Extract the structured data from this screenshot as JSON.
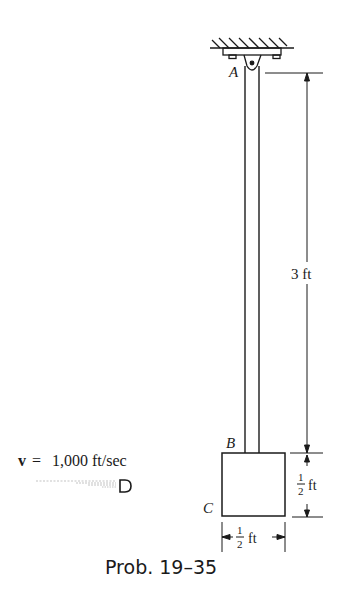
{
  "figure": {
    "caption": "Prob. 19–35",
    "labels": {
      "point_a": "A",
      "point_b": "B",
      "point_c": "C"
    },
    "velocity": {
      "symbol": "v",
      "equals": "=",
      "value": "1,000 ft/sec"
    },
    "dimensions": {
      "rod_length": "3 ft",
      "block_height_num": "1",
      "block_height_den": "2",
      "block_height_unit": "ft",
      "block_width_num": "1",
      "block_width_den": "2",
      "block_width_unit": "ft"
    },
    "colors": {
      "ink": "#1a1a1a",
      "background": "#ffffff"
    }
  }
}
